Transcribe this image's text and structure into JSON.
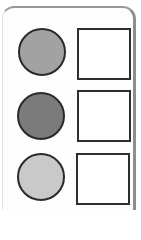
{
  "diagram": {
    "panel": {
      "border_color": "#9a9a9a",
      "background": "#fdfdfd"
    },
    "rows": [
      {
        "circle": {
          "fill": "#a2a2a2",
          "border": "#2a2a2a"
        },
        "square": {
          "fill": "#ffffff",
          "border": "#2e2e2e",
          "label": ""
        }
      },
      {
        "circle": {
          "fill": "#7b7b7b",
          "border": "#2a2a2a"
        },
        "square": {
          "fill": "#ffffff",
          "border": "#2e2e2e",
          "label": ""
        }
      },
      {
        "circle": {
          "fill": "#c9c9c9",
          "border": "#2a2a2a"
        },
        "square": {
          "fill": "#ffffff",
          "border": "#2e2e2e",
          "label": ""
        }
      }
    ]
  }
}
